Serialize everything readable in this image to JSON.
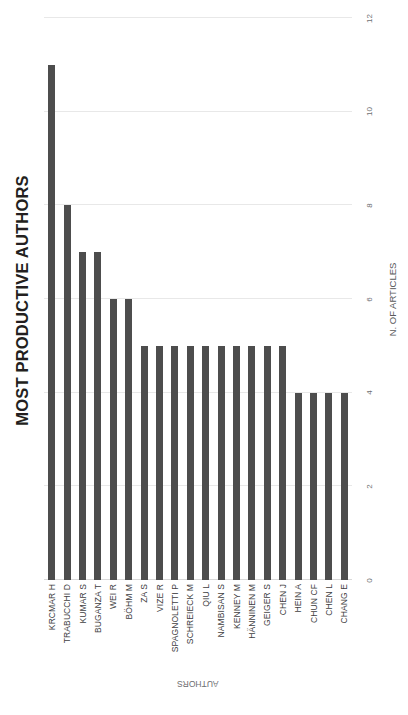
{
  "chart_data": {
    "type": "bar",
    "title": "MOST PRODUCTIVE AUTHORS",
    "xlabel": "AUTHORS",
    "ylabel": "N. OF ARTICLES",
    "orientation": "vertical-bars-rotated-90",
    "grid": true,
    "legend": false,
    "ylim": [
      0,
      12
    ],
    "yticks": [
      0,
      2,
      4,
      6,
      8,
      10,
      12
    ],
    "ytick_labels": [
      "0",
      "2",
      "4",
      "6",
      "8",
      "10",
      "12"
    ],
    "bar_color": "#4d4d4d",
    "gridline_color": "#e8e8e8",
    "categories": [
      "KRCMAR H",
      "TRABUCCHI D",
      "KUMAR S",
      "BUGANZA T",
      "WEI R",
      "BÖHM M",
      "ZA S",
      "VIZE R",
      "SPAGNOLETTI P",
      "SCHREIECK M",
      "QIU L",
      "NAMBISAN S",
      "KENNEY M",
      "HÄNNINEN M",
      "GEIGER S",
      "CHEN J",
      "HEIN A",
      "CHUN CF",
      "CHEN L",
      "CHANG E"
    ],
    "values": [
      11,
      8,
      7,
      7,
      6,
      6,
      5,
      5,
      5,
      5,
      5,
      5,
      5,
      5,
      5,
      5,
      4,
      4,
      4,
      4
    ]
  }
}
